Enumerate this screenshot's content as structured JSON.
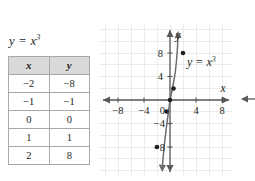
{
  "equation": {
    "base": "y = x",
    "exponent": "3",
    "full": "y = x3"
  },
  "table": {
    "headers": [
      "x",
      "y"
    ],
    "rows": [
      {
        "x": "−2",
        "y": "−8"
      },
      {
        "x": "−1",
        "y": "−1"
      },
      {
        "x": "0",
        "y": "0"
      },
      {
        "x": "1",
        "y": "1"
      },
      {
        "x": "2",
        "y": "8"
      }
    ]
  },
  "chart_data": {
    "type": "line",
    "title": "",
    "curve_label_base": "y = x",
    "curve_label_exponent": "3",
    "xlabel": "x",
    "ylabel": "y",
    "xlim": [
      -11,
      11
    ],
    "ylim": [
      -11,
      11
    ],
    "grid": true,
    "grid_step": 2,
    "x_ticks": [
      -8,
      -4,
      4,
      8
    ],
    "x_tick_labels": [
      "−8",
      "−4",
      "4",
      "8"
    ],
    "y_ticks": [
      8,
      4,
      -4,
      -8
    ],
    "y_tick_labels": [
      "8",
      "4",
      "−4",
      "−8"
    ],
    "origin_label": "0",
    "x": [
      -2,
      -1,
      0,
      1,
      2
    ],
    "values": [
      -8,
      -1,
      0,
      1,
      8
    ],
    "points": [
      {
        "x": -2,
        "y": -8
      },
      {
        "x": -1,
        "y": -1
      },
      {
        "x": 0,
        "y": 0
      },
      {
        "x": 1,
        "y": 1
      },
      {
        "x": 2,
        "y": 8
      }
    ],
    "series": [
      {
        "name": "y = x3",
        "values": [
          -8,
          -1,
          0,
          1,
          8
        ]
      }
    ],
    "colors": {
      "grid": "#e3e3e3",
      "axis": "#58595b",
      "curve": "#6d6e71",
      "point": "#231f20",
      "text": "#231f20",
      "table_header_bg": "#d9d9d9",
      "table_border": "#a9a9a9"
    }
  },
  "icons": {
    "x_axis_arrow_right": "arrow-right",
    "x_axis_arrow_left": "arrow-left",
    "y_axis_arrow_up": "arrow-up",
    "curve_arrow_up": "arrow-up",
    "curve_arrow_down": "arrow-down",
    "y_axis_arrow_down": "arrow-down",
    "edge_arrow_left": "arrow-left"
  }
}
